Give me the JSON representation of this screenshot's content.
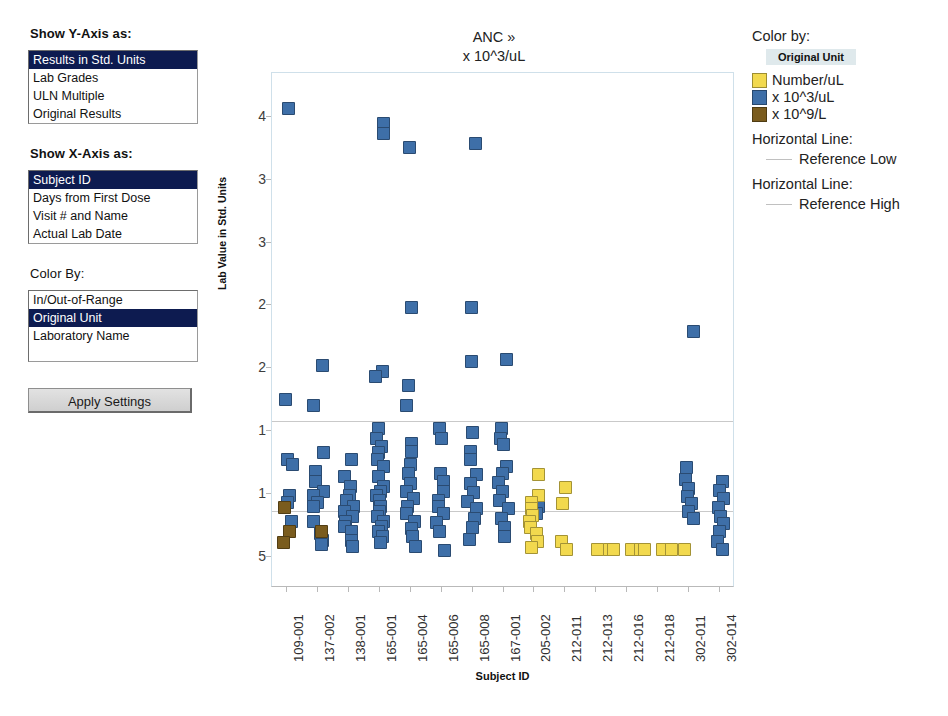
{
  "controls": {
    "y_axis": {
      "heading": "Show Y-Axis as:",
      "options": [
        "Results in Std. Units",
        "Lab Grades",
        "ULN Multiple",
        "Original Results"
      ],
      "selected": "Results in Std. Units"
    },
    "x_axis": {
      "heading": "Show X-Axis as:",
      "options": [
        "Subject ID",
        "Days from First Dose",
        "Visit # and Name",
        "Actual Lab Date"
      ],
      "selected": "Subject ID"
    },
    "color_by": {
      "heading": "Color By:",
      "options": [
        "In/Out-of-Range",
        "Original Unit",
        "Laboratory Name"
      ],
      "selected": "Original Unit"
    },
    "apply_button_label": "Apply Settings"
  },
  "legend": {
    "title": "Color by:",
    "field": "Original Unit",
    "items": [
      {
        "label": "Number/uL",
        "color": "#F2D94E"
      },
      {
        "label": "x 10^3/uL",
        "color": "#3E6FA8"
      },
      {
        "label": "x 10^9/L",
        "color": "#7A5C1E"
      }
    ],
    "lines": [
      {
        "title": "Horizontal Line:",
        "label": "Reference Low",
        "color": "#C0C0C0"
      },
      {
        "title": "Horizontal Line:",
        "label": "Reference High",
        "color": "#C0C0C0"
      }
    ]
  },
  "chart_data": {
    "type": "scatter",
    "title": "ANC »",
    "subtitle": "x 10^3/uL",
    "xlabel": "Subject ID",
    "ylabel": "Lab Value in Std. Units",
    "grid": false,
    "legend_position": "right",
    "ylim": [
      0.25,
      4.35
    ],
    "ytick_values": [
      4.0,
      3.5,
      3.0,
      2.5,
      2.0,
      1.5,
      1.0,
      0.5
    ],
    "ytick_labels": [
      "4",
      "3",
      "3",
      "2",
      "2",
      "1",
      "1",
      "5"
    ],
    "categories": [
      "109-001",
      "137-002",
      "138-001",
      "165-001",
      "165-004",
      "165-006",
      "165-008",
      "167-001",
      "205-002",
      "212-011",
      "212-013",
      "212-016",
      "212-018",
      "302-011",
      "302-014"
    ],
    "reference_lines": [
      {
        "name": "Reference High",
        "y": 1.58
      },
      {
        "name": "Reference Low",
        "y": 0.86
      }
    ],
    "series": [
      {
        "name": "x 10^3/uL",
        "color": "#3E6FA8",
        "points": [
          [
            0,
            4.07
          ],
          [
            0,
            1.75
          ],
          [
            0,
            1.27
          ],
          [
            0,
            1.23
          ],
          [
            0,
            0.99
          ],
          [
            0,
            0.93
          ],
          [
            0,
            0.78
          ],
          [
            1,
            2.02
          ],
          [
            1,
            1.7
          ],
          [
            1,
            1.33
          ],
          [
            1,
            1.18
          ],
          [
            1,
            1.1
          ],
          [
            1,
            1.02
          ],
          [
            1,
            0.99
          ],
          [
            1,
            0.93
          ],
          [
            1,
            0.9
          ],
          [
            1,
            0.78
          ],
          [
            1,
            0.68
          ],
          [
            1,
            0.63
          ],
          [
            1,
            0.6
          ],
          [
            2,
            1.27
          ],
          [
            2,
            1.14
          ],
          [
            2,
            1.06
          ],
          [
            2,
            0.99
          ],
          [
            2,
            0.95
          ],
          [
            2,
            0.9
          ],
          [
            2,
            0.86
          ],
          [
            2,
            0.82
          ],
          [
            2,
            0.78
          ],
          [
            2,
            0.74
          ],
          [
            2,
            0.7
          ],
          [
            2,
            0.63
          ],
          [
            2,
            0.58
          ],
          [
            3,
            3.95
          ],
          [
            3,
            3.87
          ],
          [
            3,
            1.97
          ],
          [
            3,
            1.93
          ],
          [
            3,
            1.52
          ],
          [
            3,
            1.44
          ],
          [
            3,
            1.38
          ],
          [
            3,
            1.33
          ],
          [
            3,
            1.27
          ],
          [
            3,
            1.22
          ],
          [
            3,
            1.14
          ],
          [
            3,
            1.06
          ],
          [
            3,
            1.02
          ],
          [
            3,
            0.99
          ],
          [
            3,
            0.95
          ],
          [
            3,
            0.9
          ],
          [
            3,
            0.86
          ],
          [
            3,
            0.82
          ],
          [
            3,
            0.78
          ],
          [
            3,
            0.74
          ],
          [
            3,
            0.7
          ],
          [
            3,
            0.66
          ],
          [
            3,
            0.61
          ],
          [
            4,
            3.76
          ],
          [
            4,
            2.48
          ],
          [
            4,
            1.86
          ],
          [
            4,
            1.7
          ],
          [
            4,
            1.4
          ],
          [
            4,
            1.34
          ],
          [
            4,
            1.23
          ],
          [
            4,
            1.16
          ],
          [
            4,
            1.08
          ],
          [
            4,
            1.02
          ],
          [
            4,
            0.96
          ],
          [
            4,
            0.9
          ],
          [
            4,
            0.84
          ],
          [
            4,
            0.78
          ],
          [
            4,
            0.72
          ],
          [
            4,
            0.66
          ],
          [
            4,
            0.58
          ],
          [
            5,
            1.52
          ],
          [
            5,
            1.44
          ],
          [
            5,
            1.16
          ],
          [
            5,
            1.1
          ],
          [
            5,
            1.02
          ],
          [
            5,
            0.95
          ],
          [
            5,
            0.9
          ],
          [
            5,
            0.84
          ],
          [
            5,
            0.77
          ],
          [
            5,
            0.7
          ],
          [
            5,
            0.55
          ],
          [
            6,
            3.79
          ],
          [
            6,
            2.48
          ],
          [
            6,
            2.05
          ],
          [
            6,
            1.49
          ],
          [
            6,
            1.34
          ],
          [
            6,
            1.27
          ],
          [
            6,
            1.15
          ],
          [
            6,
            1.08
          ],
          [
            6,
            1.01
          ],
          [
            6,
            0.94
          ],
          [
            6,
            0.88
          ],
          [
            6,
            0.8
          ],
          [
            6,
            0.73
          ],
          [
            6,
            0.64
          ],
          [
            7,
            2.07
          ],
          [
            7,
            1.52
          ],
          [
            7,
            1.44
          ],
          [
            7,
            1.39
          ],
          [
            7,
            1.22
          ],
          [
            7,
            1.16
          ],
          [
            7,
            1.09
          ],
          [
            7,
            1.02
          ],
          [
            7,
            0.95
          ],
          [
            7,
            0.88
          ],
          [
            7,
            0.8
          ],
          [
            7,
            0.73
          ],
          [
            7,
            0.66
          ],
          [
            8,
            0.9
          ],
          [
            8,
            0.84
          ],
          [
            13,
            2.29
          ],
          [
            13,
            1.21
          ],
          [
            13,
            1.11
          ],
          [
            13,
            1.04
          ],
          [
            13,
            0.98
          ],
          [
            13,
            0.92
          ],
          [
            13,
            0.86
          ],
          [
            13,
            0.8
          ],
          [
            14,
            1.1
          ],
          [
            14,
            1.03
          ],
          [
            14,
            0.96
          ],
          [
            14,
            0.89
          ],
          [
            14,
            0.82
          ],
          [
            14,
            0.76
          ],
          [
            14,
            0.7
          ],
          [
            14,
            0.62
          ],
          [
            14,
            0.56
          ]
        ]
      },
      {
        "name": "Number/uL",
        "color": "#F2D94E",
        "points": [
          [
            8,
            1.15
          ],
          [
            8,
            0.99
          ],
          [
            8,
            0.93
          ],
          [
            8,
            0.88
          ],
          [
            8,
            0.83
          ],
          [
            8,
            0.78
          ],
          [
            8,
            0.73
          ],
          [
            8,
            0.68
          ],
          [
            8,
            0.62
          ],
          [
            8,
            0.57
          ],
          [
            9,
            1.05
          ],
          [
            9,
            0.92
          ],
          [
            9,
            0.62
          ],
          [
            9,
            0.56
          ],
          [
            10,
            0.56
          ],
          [
            11,
            0.56
          ],
          [
            11,
            0.56
          ],
          [
            12,
            0.56
          ],
          [
            12,
            0.56
          ],
          [
            10,
            0.56
          ],
          [
            11,
            0.56
          ],
          [
            12,
            0.56
          ],
          [
            12,
            0.56
          ]
        ]
      },
      {
        "name": "x 10^9/L",
        "color": "#7A5C1E",
        "points": [
          [
            0,
            0.89
          ],
          [
            0,
            0.7
          ],
          [
            0,
            0.61
          ],
          [
            1,
            0.7
          ]
        ]
      }
    ]
  }
}
